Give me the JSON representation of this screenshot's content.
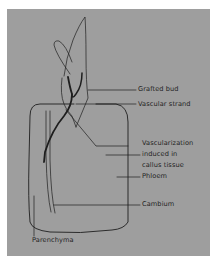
{
  "figure": {
    "background_color": "#9e9e9e",
    "line_color": "#1e1e1e",
    "labels": {
      "grafted_bud": "Grafted bud",
      "vascular_strand": "Vascular strand",
      "vascularization_line1": "Vascularization",
      "vascularization_line2": "induced in",
      "vascularization_line3": "callus tissue",
      "phloem": "Phloem",
      "cambium": "Cambium",
      "parenchyma": "Parenchyma"
    }
  }
}
